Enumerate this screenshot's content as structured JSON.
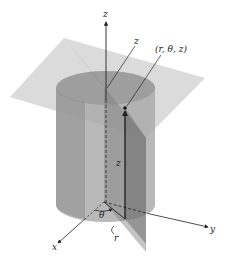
{
  "figure": {
    "labels": {
      "z_axis": "z",
      "z_pointer": "z",
      "point": "(r, θ, z)",
      "z_height": "z",
      "theta": "θ",
      "r": "r",
      "x_axis": "x",
      "y_axis": "y"
    },
    "colors": {
      "plane": "#c8c8c8",
      "cylinder": "#9a9a9a",
      "cylinder_dark": "#7a7a7a",
      "half_plane": "#8c8c8c",
      "axis": "#222222"
    }
  }
}
